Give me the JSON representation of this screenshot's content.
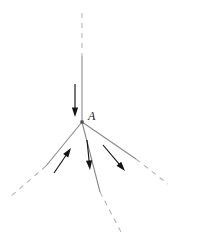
{
  "figure": {
    "background_color": "#ffffff",
    "line_color": "#8a8a8a",
    "dash_color": "#b5b5b5",
    "arrow_color": "#141414",
    "vertex_color": "#4a4a4a",
    "label_color": "#1a1a1a",
    "vertex": {
      "name": "A",
      "label": "A",
      "x": 82,
      "y": 122,
      "label_x": 88,
      "label_y": 120,
      "dot_size": 3.2
    },
    "rays": [
      {
        "name": "normal-upper-dashed",
        "style": "dashed",
        "x1": 82,
        "y1": 13,
        "x2": 82,
        "y2": 56
      },
      {
        "name": "incident-ray-solid",
        "style": "solid",
        "x1": 82,
        "y1": 56,
        "x2": 82,
        "y2": 122
      },
      {
        "name": "left-ray-solid",
        "style": "solid",
        "x1": 82,
        "y1": 122,
        "x2": 46,
        "y2": 166
      },
      {
        "name": "left-ray-dashed",
        "style": "dashed",
        "x1": 46,
        "y1": 166,
        "x2": 10,
        "y2": 197
      },
      {
        "name": "center-ray-solid",
        "style": "solid",
        "x1": 82,
        "y1": 122,
        "x2": 100,
        "y2": 192
      },
      {
        "name": "center-ray-dashed",
        "style": "dashed",
        "x1": 100,
        "y1": 192,
        "x2": 121,
        "y2": 232
      },
      {
        "name": "right-ray-solid",
        "style": "solid",
        "x1": 82,
        "y1": 122,
        "x2": 136,
        "y2": 159
      },
      {
        "name": "right-ray-dashed",
        "style": "dashed",
        "x1": 136,
        "y1": 159,
        "x2": 168,
        "y2": 184
      }
    ],
    "arrows": [
      {
        "name": "incident-direction-arrow",
        "direction": "down",
        "x1": 75,
        "y1": 84,
        "x2": 75,
        "y2": 117
      },
      {
        "name": "left-ray-direction-arrow",
        "direction": "up-right",
        "x1": 54,
        "y1": 173,
        "x2": 71,
        "y2": 148
      },
      {
        "name": "center-ray-direction-arrow",
        "direction": "down",
        "x1": 87,
        "y1": 140,
        "x2": 90,
        "y2": 170
      },
      {
        "name": "right-ray-direction-arrow",
        "direction": "down-right",
        "x1": 103,
        "y1": 145,
        "x2": 125,
        "y2": 171
      }
    ]
  }
}
